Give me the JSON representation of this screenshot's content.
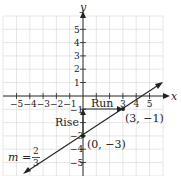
{
  "graph": {
    "x_axis_label": "x",
    "y_axis_label": "y",
    "x_ticks": [
      "−5",
      "−4",
      "−3",
      "−2",
      "−1",
      "3",
      "4",
      "5"
    ],
    "y_ticks": [
      "5",
      "4",
      "3",
      "2",
      "1",
      "−1",
      "−3",
      "−4",
      "−5"
    ],
    "points": [
      {
        "label": "(0, −3)",
        "x": 0,
        "y": -3
      },
      {
        "label": "(3, −1)",
        "x": 3,
        "y": -1
      }
    ],
    "run_label": "Run",
    "rise_label": "Rise",
    "slope_label_prefix": "m =",
    "slope_numerator": "2",
    "slope_denominator": "3",
    "colors": {
      "grid": "#d8d8d8",
      "axis": "#222222",
      "line": "#222222"
    }
  }
}
